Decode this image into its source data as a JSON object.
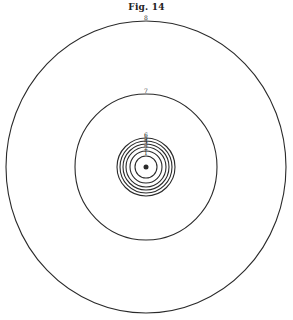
{
  "figure": {
    "title": "Fig. 14",
    "center": [
      146,
      167
    ],
    "rings": [
      {
        "label": "1",
        "rx": 11,
        "ry": 11
      },
      {
        "label": "2",
        "rx": 16,
        "ry": 16
      },
      {
        "label": "3",
        "rx": 20,
        "ry": 20
      },
      {
        "label": "4",
        "rx": 23,
        "ry": 23
      },
      {
        "label": "5",
        "rx": 26,
        "ry": 26
      },
      {
        "label": "6",
        "rx": 29,
        "ry": 29
      },
      {
        "label": "7",
        "rx": 71,
        "ry": 73
      },
      {
        "label": "8",
        "rx": 140,
        "ry": 146
      }
    ],
    "center_dot": {
      "r": 2.5
    }
  },
  "colors": {
    "ink": "#2a2a2a",
    "paper": "#ffffff"
  }
}
